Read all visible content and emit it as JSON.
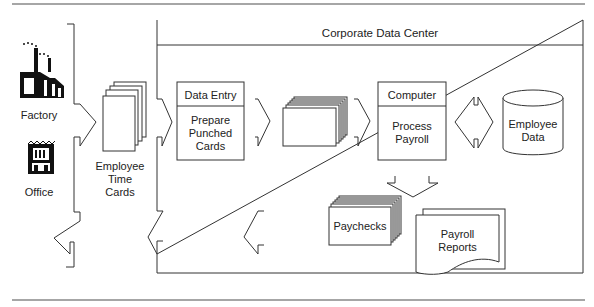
{
  "diagram": {
    "container_title": "Corporate Data Center",
    "sources": [
      {
        "label": "Factory",
        "icon": "factory-icon"
      },
      {
        "label": "Office",
        "icon": "office-building-icon"
      }
    ],
    "time_cards": {
      "line1": "Employee",
      "line2": "Time",
      "line3": "Cards"
    },
    "data_entry": {
      "header": "Data Entry",
      "line1": "Prepare",
      "line2": "Punched",
      "line3": "Cards"
    },
    "computer": {
      "header": "Computer",
      "line1": "Process",
      "line2": "Payroll"
    },
    "employee_data": {
      "line1": "Employee",
      "line2": "Data"
    },
    "paychecks": {
      "label": "Paychecks"
    },
    "payroll_reports": {
      "line1": "Payroll",
      "line2": "Reports"
    },
    "colors": {
      "stroke": "#333333",
      "rule": "#888888"
    }
  }
}
